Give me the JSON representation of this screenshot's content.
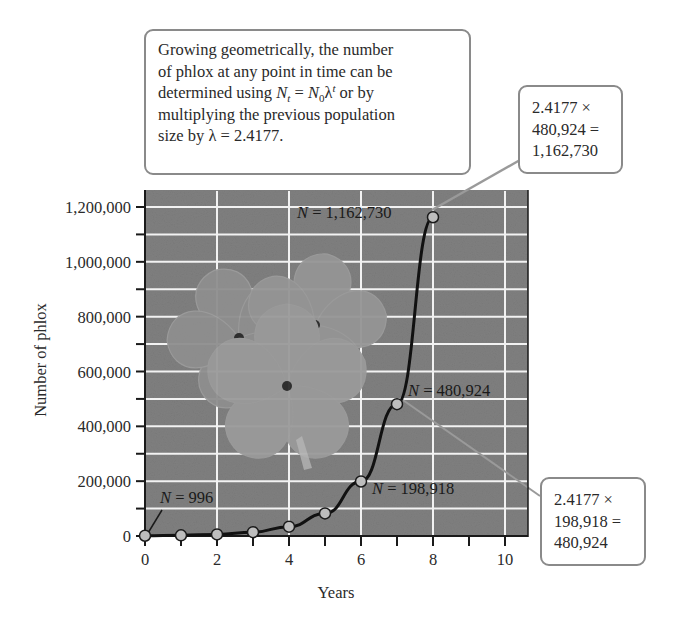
{
  "chart_data": {
    "type": "line",
    "title": "",
    "xlabel": "Years",
    "ylabel": "Number of phlox",
    "x": [
      0,
      1,
      2,
      3,
      4,
      5,
      6,
      7,
      8
    ],
    "series": [
      {
        "name": "Phlox population (geometric growth)",
        "values": [
          996,
          2408,
          5822,
          14076,
          34032,
          82279,
          198918,
          480924,
          1162730
        ]
      }
    ],
    "xlim": [
      0,
      10.6
    ],
    "ylim": [
      0,
      1300000
    ],
    "x_ticks": [
      0,
      1,
      2,
      3,
      4,
      5,
      6,
      7,
      8,
      9,
      10
    ],
    "x_tick_labels": [
      "0",
      "2",
      "4",
      "6",
      "8",
      "10"
    ],
    "y_ticks": [
      0,
      100000,
      200000,
      300000,
      400000,
      500000,
      600000,
      700000,
      800000,
      900000,
      1000000,
      1100000,
      1200000
    ],
    "y_tick_labels": [
      "0",
      "200,000",
      "400,000",
      "600,000",
      "800,000",
      "1,000,000",
      "1,200,000"
    ],
    "grid": true,
    "legend": "none",
    "annotations": [
      {
        "x": 0,
        "text": "N = 996"
      },
      {
        "x": 6,
        "text": "N = 198,918"
      },
      {
        "x": 7,
        "text": "N = 480,924"
      },
      {
        "x": 8,
        "text": "N = 1,162,730"
      }
    ],
    "lambda": 2.4177
  },
  "callouts": {
    "main": {
      "lines": [
        "Growing geometrically, the number",
        "of phlox at any point in time can be",
        "multiplying the previous population",
        "size by λ = 2.4177."
      ],
      "formula_prefix": "determined using ",
      "formula_N": "N",
      "formula_t": "t",
      "formula_eq": " = ",
      "formula_N0": "N",
      "formula_0": "0",
      "formula_lambda": "λ",
      "formula_exp": "t",
      "formula_suffix": " or by"
    },
    "top_right": {
      "rows": [
        "2.4177 ×",
        "480,924 =",
        "1,162,730"
      ]
    },
    "bottom_right": {
      "rows": [
        "2.4177 ×",
        "198,918 =",
        "480,924"
      ]
    }
  },
  "point_labels": {
    "p0": {
      "n": "N",
      "rest": " = 996"
    },
    "p6": {
      "n": "N",
      "rest": " = 198,918"
    },
    "p7": {
      "n": "N",
      "rest": " = 480,924"
    },
    "p8": {
      "n": "N",
      "rest": " = 1,162,730"
    }
  },
  "colors": {
    "plot_bg": "#7f7f7f",
    "grid": "#f2f2f2",
    "line": "#111111",
    "marker_fill": "#bdbdbd",
    "callout_border": "#8a8a8a"
  },
  "decor": {
    "illustration": "phlox-flowers-illustration"
  }
}
